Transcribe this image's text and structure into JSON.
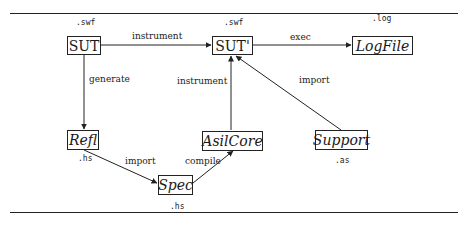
{
  "nodes": {
    "sut": {
      "label": "SUT",
      "ext": ".swf"
    },
    "sut_prime": {
      "label": "SUT'",
      "ext": ".swf"
    },
    "logfile": {
      "label": "LogFile",
      "ext": ".log"
    },
    "refl": {
      "label": "Refl",
      "ext": ".hs"
    },
    "asilcore": {
      "label": "AsilCore"
    },
    "support": {
      "label": "Support",
      "ext": ".as"
    },
    "spec": {
      "label": "Spec",
      "ext": ".hs"
    }
  },
  "edges": {
    "sut_to_sutprime": "instrument",
    "sutprime_to_logfile": "exec",
    "sut_to_refl": "generate",
    "asilcore_to_sutprime": "instrument",
    "support_to_sutprime": "import",
    "refl_to_spec": "import",
    "spec_to_asilcore": "compile"
  }
}
